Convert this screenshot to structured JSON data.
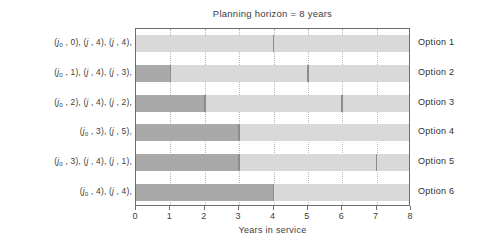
{
  "chart_data": {
    "type": "bar",
    "title": "Planning horizon = 8 years",
    "xlabel": "Years in service",
    "ylabel": "",
    "xlim": [
      0,
      8
    ],
    "xticks": [
      0,
      1,
      2,
      3,
      4,
      5,
      6,
      7,
      8
    ],
    "grid": true,
    "legend": "none",
    "orientation": "horizontal",
    "categories": [
      "Option 1",
      "Option 2",
      "Option 3",
      "Option 4",
      "Option 5",
      "Option 6"
    ],
    "series": [
      {
        "name": "Option 1",
        "label": "(j₀ , 0), (j , 4), (j , 4),",
        "right_label": "Option 1",
        "total": 8,
        "segments": [
          {
            "start": 0,
            "end": 4,
            "shade": "light"
          },
          {
            "start": 4,
            "end": 8,
            "shade": "light"
          }
        ],
        "breakpoints": [
          4
        ]
      },
      {
        "name": "Option 2",
        "label": "(j₀ , 1), (j , 4), (j , 3),",
        "right_label": "Option 2",
        "total": 8,
        "segments": [
          {
            "start": 0,
            "end": 1,
            "shade": "dark"
          },
          {
            "start": 1,
            "end": 5,
            "shade": "light"
          },
          {
            "start": 5,
            "end": 8,
            "shade": "light"
          }
        ],
        "breakpoints": [
          1,
          5
        ]
      },
      {
        "name": "Option 3",
        "label": "(j₀ , 2), (j , 4), (j , 2),",
        "right_label": "Option 3",
        "total": 8,
        "segments": [
          {
            "start": 0,
            "end": 2,
            "shade": "dark"
          },
          {
            "start": 2,
            "end": 6,
            "shade": "light"
          },
          {
            "start": 6,
            "end": 8,
            "shade": "light"
          }
        ],
        "breakpoints": [
          2,
          6
        ]
      },
      {
        "name": "Option 4",
        "label": "(j₀ , 3), (j , 5),",
        "right_label": "Option 4",
        "total": 8,
        "segments": [
          {
            "start": 0,
            "end": 3,
            "shade": "dark"
          },
          {
            "start": 3,
            "end": 8,
            "shade": "light"
          }
        ],
        "breakpoints": [
          3
        ]
      },
      {
        "name": "Option 5",
        "label": "(j₀ , 3), (j , 4), (j , 1),",
        "right_label": "Option 5",
        "total": 8,
        "segments": [
          {
            "start": 0,
            "end": 3,
            "shade": "dark"
          },
          {
            "start": 3,
            "end": 7,
            "shade": "light"
          },
          {
            "start": 7,
            "end": 8,
            "shade": "light"
          }
        ],
        "breakpoints": [
          3,
          7
        ]
      },
      {
        "name": "Option 6",
        "label": "(j₀ , 4), (j , 4),",
        "right_label": "Option 6",
        "total": 8,
        "segments": [
          {
            "start": 0,
            "end": 4,
            "shade": "dark"
          },
          {
            "start": 4,
            "end": 8,
            "shade": "light"
          }
        ],
        "breakpoints": [
          4
        ]
      }
    ],
    "colors": {
      "dark_segment": "#a9a9a9",
      "light_segment": "#d9d9d9",
      "axis": "#6d6d6d",
      "gridline": "#b8b8b8",
      "text": "#3d3d3d",
      "background": "#ffffff"
    }
  }
}
